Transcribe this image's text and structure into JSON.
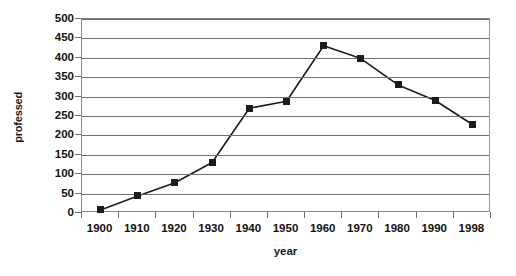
{
  "chart_data": {
    "type": "line",
    "title": "",
    "xlabel": "year",
    "ylabel": "professed",
    "categories": [
      "1900",
      "1910",
      "1920",
      "1930",
      "1940",
      "1950",
      "1960",
      "1970",
      "1980",
      "1990",
      "1998"
    ],
    "values": [
      8,
      44,
      78,
      130,
      270,
      288,
      431,
      398,
      330,
      290,
      228
    ],
    "series": [
      {
        "name": "professed",
        "values": [
          8,
          44,
          78,
          130,
          270,
          288,
          431,
          398,
          330,
          290,
          228
        ]
      }
    ],
    "ylim": [
      0,
      500
    ],
    "y_ticks": [
      0,
      50,
      100,
      150,
      200,
      250,
      300,
      350,
      400,
      450,
      500
    ],
    "y_tick_labels": [
      "0",
      "50",
      "100",
      "150",
      "200",
      "250",
      "300",
      "350",
      "400",
      "450",
      "500"
    ],
    "grid": true,
    "grid_axis": "y",
    "legend": false,
    "legend_position": "none",
    "marker": "square",
    "line_color": "#1c1c1c",
    "marker_color": "#1c1c1c",
    "grid_color": "#6f6f6f",
    "axis_color": "#8a8a8a",
    "background_color": "#ffffff"
  }
}
